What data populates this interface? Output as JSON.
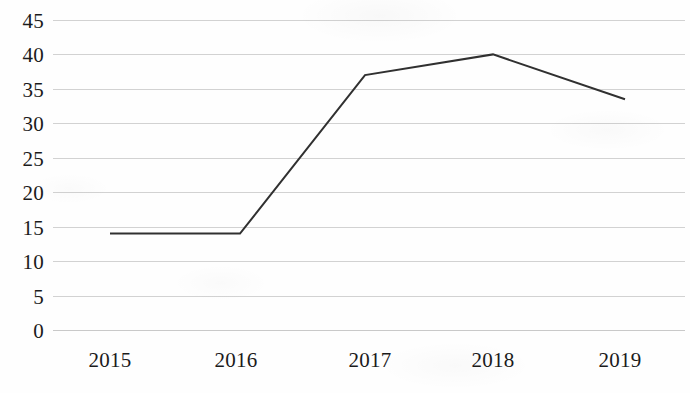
{
  "chart_data": {
    "type": "line",
    "title": "",
    "subtitle": "",
    "xlabel": "",
    "ylabel": "",
    "categories": [
      "2015",
      "2016",
      "2017",
      "2018",
      "2019"
    ],
    "x": [
      2015,
      2016,
      2017,
      2018,
      2019
    ],
    "series": [
      {
        "name": "series-1",
        "values": [
          14,
          14,
          37,
          40,
          33.5
        ],
        "color": "#303030",
        "line_width": 2,
        "markers": false
      }
    ],
    "values": [
      14,
      14,
      37,
      40,
      33.5
    ],
    "ylim": [
      0,
      45
    ],
    "y_ticks": [
      0,
      5,
      10,
      15,
      20,
      25,
      30,
      35,
      40,
      45
    ],
    "y_tick_labels": [
      "0",
      "5",
      "10",
      "15",
      "20",
      "25",
      "30",
      "35",
      "40",
      "45"
    ],
    "x_tick_labels": [
      "2015",
      "2016",
      "2017",
      "2018",
      "2019"
    ],
    "grid": {
      "horizontal": true,
      "vertical": false,
      "color": "#d2d2d2"
    },
    "legend": {
      "visible": false,
      "position": "none",
      "entries": []
    },
    "annotations": [],
    "background_color": "#fefefe",
    "axis_text_color": "#1b1b1b"
  },
  "axes": {
    "y_labels": [
      {
        "text": "45",
        "value": 45
      },
      {
        "text": "40",
        "value": 40
      },
      {
        "text": "35",
        "value": 35
      },
      {
        "text": "30",
        "value": 30
      },
      {
        "text": "25",
        "value": 25
      },
      {
        "text": "20",
        "value": 20
      },
      {
        "text": "15",
        "value": 15
      },
      {
        "text": "10",
        "value": 10
      },
      {
        "text": "5",
        "value": 5
      },
      {
        "text": "0",
        "value": 0
      }
    ],
    "x_labels": [
      {
        "text": "2015"
      },
      {
        "text": "2016"
      },
      {
        "text": "2017"
      },
      {
        "text": "2018"
      },
      {
        "text": "2019"
      }
    ]
  }
}
